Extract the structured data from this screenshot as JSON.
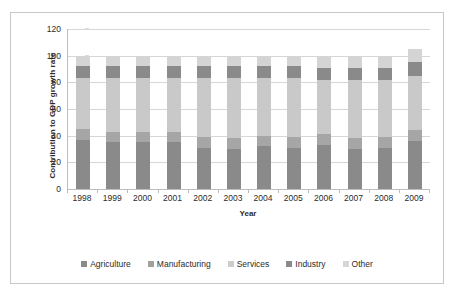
{
  "chart_data": {
    "type": "bar",
    "subtype": "stacked-column",
    "title": "",
    "xlabel": "Year",
    "ylabel": "Contribution to GDP growth rate",
    "categories": [
      "1998",
      "1999",
      "2000",
      "2001",
      "2002",
      "2003",
      "2004",
      "2005",
      "2006",
      "2007",
      "2008",
      "2009"
    ],
    "ylim": [
      0,
      120
    ],
    "yticks": [
      0,
      20,
      40,
      60,
      80,
      100,
      120
    ],
    "grid": true,
    "legend_position": "bottom",
    "series": [
      {
        "name": "Agriculture",
        "color": "#8a8a8a",
        "values": [
          37,
          35,
          35,
          35,
          31,
          30,
          32,
          31,
          33,
          30,
          31,
          36
        ]
      },
      {
        "name": "Manufacturing",
        "color": "#a6a6a6",
        "values": [
          8,
          8,
          8,
          8,
          8,
          8,
          8,
          8,
          8,
          8,
          8,
          8
        ]
      },
      {
        "name": "Services",
        "color": "#c9c9c9",
        "values": [
          38,
          40,
          40,
          40,
          44,
          45,
          43,
          44,
          41,
          44,
          43,
          41
        ]
      },
      {
        "name": "Industry",
        "color": "#8a8a8a",
        "values": [
          9,
          9,
          9,
          9,
          9,
          9,
          9,
          9,
          9,
          9,
          9,
          10
        ]
      },
      {
        "name": "Other",
        "color": "#d4d4d4",
        "values": [
          8,
          8,
          8,
          8,
          8,
          8,
          8,
          8,
          9,
          9,
          9,
          10
        ]
      }
    ],
    "totals": [
      100,
      100,
      100,
      100,
      100,
      100,
      100,
      100,
      100,
      100,
      100,
      105
    ]
  },
  "axes": {
    "y_title": "Contribution to GDP growth rate",
    "x_title": "Year",
    "y_tick_labels": [
      "0",
      "20",
      "40",
      "60",
      "80",
      "100",
      "120"
    ],
    "x_tick_labels": [
      "1998",
      "1999",
      "2000",
      "2001",
      "2002",
      "2003",
      "2004",
      "2005",
      "2006",
      "2007",
      "2008",
      "2009"
    ]
  },
  "legend": {
    "items": [
      {
        "label": "Agriculture",
        "color": "#8a8a8a"
      },
      {
        "label": "Manufacturing",
        "color": "#a0a0a0"
      },
      {
        "label": "Services",
        "color": "#cccccc"
      },
      {
        "label": "Industry",
        "color": "#8a8a8a"
      },
      {
        "label": "Other",
        "color": "#d6d6d6"
      }
    ]
  },
  "colors": {
    "gridline": "#d7d7d7",
    "axis": "#bdbdbd",
    "frame_border": "#c9c9c9",
    "text": "#2b2b2b",
    "background": "#ffffff"
  }
}
